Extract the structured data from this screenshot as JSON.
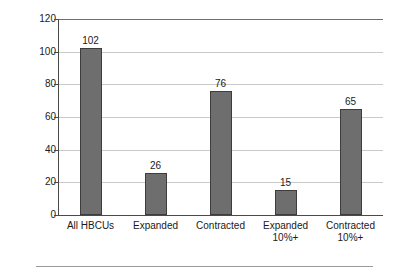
{
  "chart_data": {
    "type": "bar",
    "title": "",
    "xlabel": "",
    "ylabel": "Number of HBCUs",
    "categories": [
      "All HBCUs",
      "Expanded",
      "Contracted",
      "Expanded 10%+",
      "Contracted 10%+"
    ],
    "category_lines": [
      [
        "All HBCUs"
      ],
      [
        "Expanded"
      ],
      [
        "Contracted"
      ],
      [
        "Expanded",
        "10%+"
      ],
      [
        "Contracted",
        "10%+"
      ]
    ],
    "values": [
      102,
      26,
      76,
      15,
      65
    ],
    "value_labels": [
      "102",
      "26",
      "76",
      "15",
      "65"
    ],
    "ylim": [
      0,
      120
    ],
    "yticks": [
      120,
      100,
      80,
      60,
      40,
      20,
      0
    ],
    "ytick_labels": [
      "120",
      "100",
      "80",
      "60",
      "40",
      "20",
      "0"
    ],
    "grid": true,
    "legend": false,
    "bar_color": "#6e6e6e",
    "bar_edge_color": "#3d3d3d",
    "gridline_color": "#c9c9c9",
    "axis_color": "#4a4a4a",
    "background_color": "#ffffff"
  }
}
